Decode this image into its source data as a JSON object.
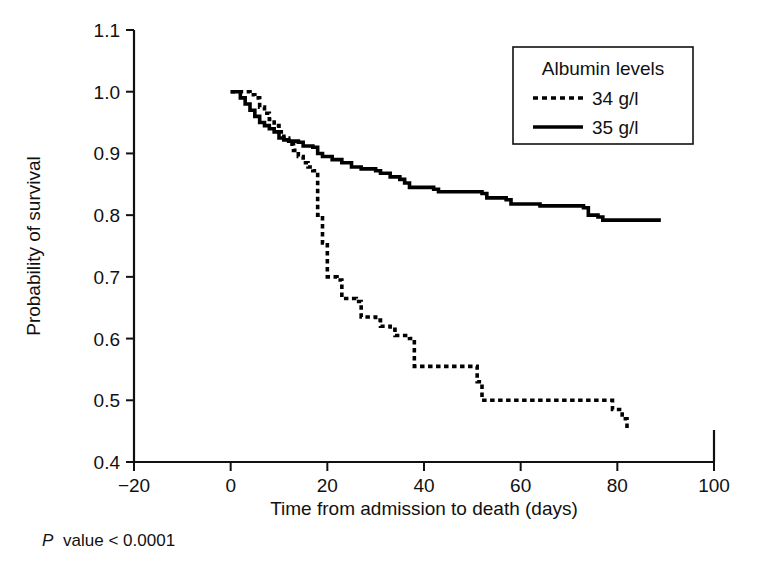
{
  "chart_data": {
    "type": "line",
    "title": "",
    "xlabel": "Time from admission to death (days)",
    "ylabel": "Probability of survival",
    "xlim": [
      -20,
      100
    ],
    "ylim": [
      0.4,
      1.1
    ],
    "xticks": [
      -20,
      0,
      20,
      40,
      60,
      80,
      100
    ],
    "xtick_labels": [
      "−20",
      "0",
      "20",
      "40",
      "60",
      "80",
      "100"
    ],
    "yticks": [
      0.4,
      0.5,
      0.6,
      0.7,
      0.8,
      0.9,
      1.0,
      1.1
    ],
    "ytick_labels": [
      "0.4",
      "0.5",
      "0.6",
      "0.7",
      "0.8",
      "0.9",
      "1.0",
      "1.1"
    ],
    "grid": false,
    "legend_position": "top-right",
    "legend_title": "Albumin levels",
    "annotation": "P value < 0.0001",
    "annotation_italic_prefix": "P",
    "annotation_rest": "value < 0.0001",
    "series": [
      {
        "name": "34 g/l",
        "legend_label": "34 g/l",
        "style": "dashed",
        "color": "#000000",
        "points": [
          [
            0,
            1.0
          ],
          [
            3,
            1.0
          ],
          [
            4,
            0.995
          ],
          [
            5,
            0.99
          ],
          [
            6,
            0.975
          ],
          [
            7,
            0.965
          ],
          [
            8,
            0.955
          ],
          [
            9,
            0.945
          ],
          [
            10,
            0.935
          ],
          [
            11,
            0.925
          ],
          [
            12,
            0.915
          ],
          [
            13,
            0.905
          ],
          [
            14,
            0.895
          ],
          [
            15,
            0.885
          ],
          [
            16,
            0.878
          ],
          [
            17,
            0.872
          ],
          [
            18,
            0.8
          ],
          [
            19,
            0.755
          ],
          [
            20,
            0.7
          ],
          [
            22,
            0.695
          ],
          [
            23,
            0.665
          ],
          [
            26,
            0.66
          ],
          [
            27,
            0.635
          ],
          [
            30,
            0.63
          ],
          [
            31,
            0.62
          ],
          [
            33,
            0.615
          ],
          [
            34,
            0.605
          ],
          [
            37,
            0.6
          ],
          [
            38,
            0.555
          ],
          [
            50,
            0.555
          ],
          [
            51,
            0.53
          ],
          [
            52,
            0.5
          ],
          [
            78,
            0.5
          ],
          [
            79,
            0.485
          ],
          [
            81,
            0.47
          ],
          [
            82,
            0.455
          ]
        ]
      },
      {
        "name": "35 g/l",
        "legend_label": "35 g/l",
        "style": "solid",
        "color": "#000000",
        "points": [
          [
            0,
            1.0
          ],
          [
            2,
            0.99
          ],
          [
            3,
            0.98
          ],
          [
            4,
            0.97
          ],
          [
            5,
            0.96
          ],
          [
            6,
            0.95
          ],
          [
            7,
            0.945
          ],
          [
            8,
            0.94
          ],
          [
            9,
            0.935
          ],
          [
            10,
            0.925
          ],
          [
            11,
            0.922
          ],
          [
            12,
            0.92
          ],
          [
            14,
            0.918
          ],
          [
            15,
            0.912
          ],
          [
            17,
            0.91
          ],
          [
            18,
            0.9
          ],
          [
            19,
            0.895
          ],
          [
            21,
            0.89
          ],
          [
            23,
            0.885
          ],
          [
            25,
            0.878
          ],
          [
            27,
            0.875
          ],
          [
            30,
            0.872
          ],
          [
            31,
            0.868
          ],
          [
            33,
            0.862
          ],
          [
            35,
            0.858
          ],
          [
            36,
            0.852
          ],
          [
            37,
            0.845
          ],
          [
            42,
            0.842
          ],
          [
            43,
            0.838
          ],
          [
            52,
            0.835
          ],
          [
            53,
            0.828
          ],
          [
            57,
            0.825
          ],
          [
            58,
            0.818
          ],
          [
            64,
            0.815
          ],
          [
            73,
            0.812
          ],
          [
            74,
            0.8
          ],
          [
            76,
            0.797
          ],
          [
            77,
            0.792
          ],
          [
            89,
            0.792
          ]
        ]
      }
    ]
  },
  "figure": {
    "y_axis_title": "Probability of survival",
    "x_axis_title": "Time from admission to death (days)"
  }
}
